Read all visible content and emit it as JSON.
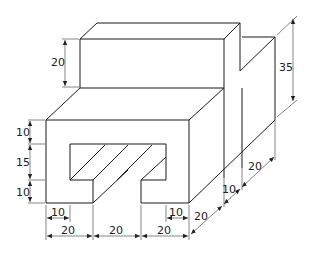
{
  "figure": {
    "type": "isometric-technical-drawing",
    "units": "mm",
    "colors": {
      "line": "#1a1a1a",
      "background": "#ffffff"
    }
  },
  "dimensions": {
    "upper_block_height": "20",
    "overall_height": "35",
    "left_top_band": "10",
    "left_slot_height": "15",
    "left_bottom_band": "10",
    "bottom_left_tab": "10",
    "bottom_right_tab": "10",
    "bottom_width_1": "20",
    "bottom_width_2": "20",
    "bottom_width_3": "20",
    "depth_front": "20",
    "depth_mid": "10",
    "depth_back": "20"
  }
}
